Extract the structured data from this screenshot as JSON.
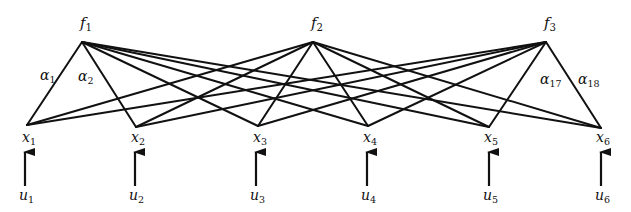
{
  "diagram": {
    "type": "bipartite-network",
    "colors": {
      "line": "#111111",
      "text": "#111111",
      "background": "#ffffff"
    },
    "f_nodes": [
      {
        "id": "f1",
        "base": "f",
        "sub": "1",
        "x": 82,
        "y": 42,
        "label_x": 80,
        "label_y": 28
      },
      {
        "id": "f2",
        "base": "f",
        "sub": "2",
        "x": 313,
        "y": 42,
        "label_x": 311,
        "label_y": 28
      },
      {
        "id": "f3",
        "base": "f",
        "sub": "3",
        "x": 546,
        "y": 42,
        "label_x": 544,
        "label_y": 28
      }
    ],
    "x_nodes": [
      {
        "id": "x1",
        "base": "x",
        "sub": "1",
        "x": 27,
        "y": 125
      },
      {
        "id": "x2",
        "base": "x",
        "sub": "2",
        "x": 136,
        "y": 127
      },
      {
        "id": "x3",
        "base": "x",
        "sub": "3",
        "x": 258,
        "y": 126
      },
      {
        "id": "x4",
        "base": "x",
        "sub": "4",
        "x": 368,
        "y": 126
      },
      {
        "id": "x5",
        "base": "x",
        "sub": "5",
        "x": 489,
        "y": 127
      },
      {
        "id": "x6",
        "base": "x",
        "sub": "6",
        "x": 601,
        "y": 128
      }
    ],
    "inputs": [
      {
        "id": "u1",
        "base": "u",
        "sub": "1",
        "x": 25
      },
      {
        "id": "u2",
        "base": "u",
        "sub": "2",
        "x": 135
      },
      {
        "id": "u3",
        "base": "u",
        "sub": "3",
        "x": 256
      },
      {
        "id": "u4",
        "base": "u",
        "sub": "4",
        "x": 367
      },
      {
        "id": "u5",
        "base": "u",
        "sub": "5",
        "x": 489
      },
      {
        "id": "u6",
        "base": "u",
        "sub": "6",
        "x": 601
      }
    ],
    "x_label_y": 142,
    "arrow": {
      "tip_y": 150,
      "tail_y": 186
    },
    "u_label_y": 200,
    "edge_labels": [
      {
        "base": "α",
        "sub": "1",
        "x": 40,
        "y": 80
      },
      {
        "base": "α",
        "sub": "2",
        "x": 78,
        "y": 81
      },
      {
        "base": "α",
        "sub": "17",
        "x": 540,
        "y": 84
      },
      {
        "base": "α",
        "sub": "18",
        "x": 578,
        "y": 84
      }
    ],
    "edges_note": "complete bipartite: each f node connects to all six x nodes (18 edges α1–α18)"
  }
}
